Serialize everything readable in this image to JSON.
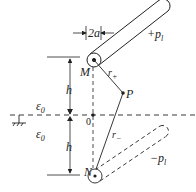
{
  "diagram": {
    "labels": {
      "width": "2a",
      "plus_charge": "+p",
      "plus_charge_sub": "l",
      "minus_charge": "−p",
      "minus_charge_sub": "l",
      "point_M": "M",
      "point_N": "N",
      "point_P": "P",
      "origin": "0",
      "r_plus": "r",
      "r_plus_sub": "+",
      "r_minus": "r",
      "r_minus_sub": "−",
      "h_upper": "h",
      "h_lower": "h",
      "eps_upper": "ε",
      "eps_upper_sub": "0",
      "eps_lower": "ε",
      "eps_lower_sub": "0"
    },
    "colors": {
      "stroke": "#222222",
      "background": "#ffffff"
    }
  }
}
